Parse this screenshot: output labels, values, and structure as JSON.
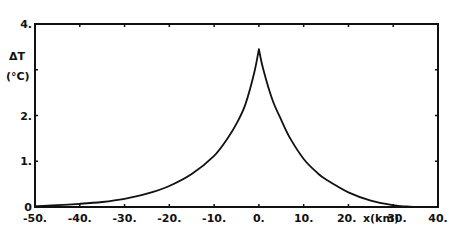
{
  "chart_data": {
    "type": "line",
    "title": "",
    "xlabel": "x(km)",
    "ylabel": "ΔT (°C)",
    "ylabel_line1": "ΔT",
    "ylabel_line2": "(°C)",
    "xlim": [
      -50,
      40
    ],
    "ylim": [
      0,
      4
    ],
    "grid": false,
    "legend": null,
    "x_ticks": [
      -50,
      -40,
      -30,
      -20,
      -10,
      0,
      10,
      20,
      30,
      40
    ],
    "x_tick_labels": [
      "-50.",
      "-40.",
      "-30.",
      "-20.",
      "-10.",
      "0.",
      "10.",
      "20.",
      "30.",
      "40."
    ],
    "y_ticks": [
      0,
      1,
      2,
      3,
      4
    ],
    "y_tick_labels": [
      "0",
      "1.",
      "2.",
      "",
      "4."
    ],
    "series": [
      {
        "name": "ΔT",
        "x": [
          -50,
          -45,
          -40,
          -35,
          -30,
          -25,
          -20,
          -15,
          -10,
          -7,
          -5,
          -3,
          -1,
          0,
          1,
          3,
          5,
          7,
          10,
          13,
          15,
          20,
          25,
          30,
          33,
          35
        ],
        "y": [
          0.02,
          0.04,
          0.07,
          0.11,
          0.18,
          0.29,
          0.46,
          0.72,
          1.12,
          1.5,
          1.82,
          2.25,
          2.95,
          3.45,
          3.0,
          2.35,
          1.9,
          1.5,
          1.05,
          0.75,
          0.6,
          0.32,
          0.14,
          0.04,
          0.01,
          0.0
        ]
      }
    ]
  }
}
